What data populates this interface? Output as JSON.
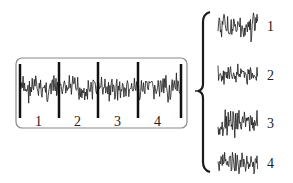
{
  "diagram": {
    "type": "signal-segmentation",
    "continuous_signal": {
      "segments": [
        "1",
        "2",
        "3",
        "4"
      ]
    },
    "separated_segments": [
      {
        "label": "1"
      },
      {
        "label": "2"
      },
      {
        "label": "3"
      },
      {
        "label": "4"
      }
    ],
    "colors": {
      "signal": "#1a1a1a",
      "box_border": "#888888",
      "divider": "#111111",
      "background": "#ffffff"
    }
  }
}
